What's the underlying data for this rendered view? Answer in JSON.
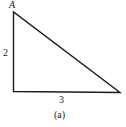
{
  "figure": {
    "caption": "(a)",
    "type": "right-triangle",
    "vertices": {
      "top": {
        "label": "A",
        "x": 13,
        "y": 12
      },
      "right_angle": {
        "label": "",
        "x": 13,
        "y": 91
      },
      "bottom_right": {
        "label": "",
        "x": 120,
        "y": 92
      }
    },
    "sides": {
      "vertical": {
        "label": "2"
      },
      "horizontal": {
        "label": "3"
      }
    },
    "colors": {
      "stroke": "#1a1a1a",
      "background": "#ffffff"
    }
  }
}
